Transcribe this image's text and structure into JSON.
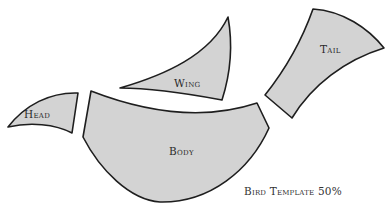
{
  "diagram": {
    "title": "Bird Template 50%",
    "fill_color": "#d3d3d3",
    "stroke_color": "#1e1e1e",
    "background": "#ffffff",
    "pieces": [
      {
        "id": "head",
        "label": "Head"
      },
      {
        "id": "wing",
        "label": "Wing"
      },
      {
        "id": "tail",
        "label": "Tail"
      },
      {
        "id": "body",
        "label": "Body"
      }
    ]
  }
}
